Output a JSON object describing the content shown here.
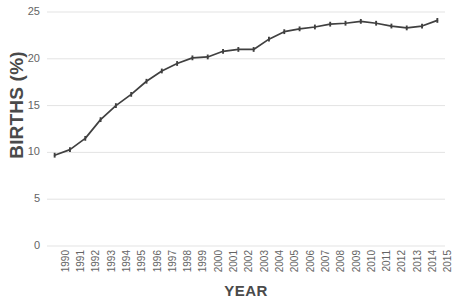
{
  "chart_data": {
    "type": "line",
    "title": "",
    "xlabel": "YEAR",
    "ylabel": "BIRTHS (%)",
    "xlim": [
      1990,
      2015
    ],
    "ylim": [
      0,
      25
    ],
    "grid": true,
    "legend": "none",
    "y_ticks": [
      25,
      20,
      15,
      10,
      5,
      0
    ],
    "y_tick_labels": [
      "25",
      "20",
      "15",
      "10",
      "5",
      "0"
    ],
    "categories": [
      "1990",
      "1991",
      "1992",
      "1993",
      "1994",
      "1995",
      "1996",
      "1997",
      "1998",
      "1999",
      "2000",
      "2001",
      "2002",
      "2003",
      "2004",
      "2005",
      "2006",
      "2007",
      "2008",
      "2009",
      "2010",
      "2011",
      "2012",
      "2013",
      "2014",
      "2015"
    ],
    "values": [
      9.7,
      10.3,
      11.5,
      13.5,
      15.0,
      16.2,
      17.6,
      18.7,
      19.5,
      20.1,
      20.2,
      20.8,
      21.0,
      21.0,
      22.1,
      22.9,
      23.2,
      23.4,
      23.7,
      23.8,
      24.0,
      23.8,
      23.5,
      23.3,
      23.5,
      24.1
    ],
    "series": [
      {
        "name": "Births",
        "color": "#404040",
        "marker": "tick",
        "values": [
          9.7,
          10.3,
          11.5,
          13.5,
          15.0,
          16.2,
          17.6,
          18.7,
          19.5,
          20.1,
          20.2,
          20.8,
          21.0,
          21.0,
          22.1,
          22.9,
          23.2,
          23.4,
          23.7,
          23.8,
          24.0,
          23.8,
          23.5,
          23.3,
          23.5,
          24.1
        ]
      }
    ],
    "colors": {
      "line": "#404040",
      "gridline": "#e3e3e3",
      "text": "#646464",
      "axis_title": "#4a4a4a",
      "background": "#ffffff"
    }
  }
}
